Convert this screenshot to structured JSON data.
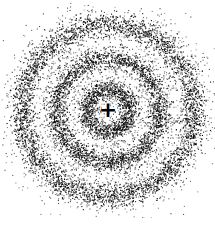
{
  "diagram": {
    "type": "electron-probability-density",
    "width": 215,
    "height": 218,
    "background": "#ffffff",
    "dot_color": "#000000",
    "center": {
      "x": 108,
      "y": 110
    },
    "nucleus": {
      "label": "+"
    },
    "rings": [
      {
        "name": "inner-shell",
        "radius": 22,
        "spread": 4.5,
        "dots": 1100,
        "halo": 9,
        "halo_dots": 450
      },
      {
        "name": "middle-shell",
        "radius": 52,
        "spread": 5,
        "dots": 2300,
        "halo": 12,
        "halo_dots": 900
      },
      {
        "name": "outer-shell",
        "radius": 86,
        "spread": 6,
        "dots": 3400,
        "halo": 15,
        "halo_dots": 1500
      }
    ],
    "background_dots": 500
  }
}
